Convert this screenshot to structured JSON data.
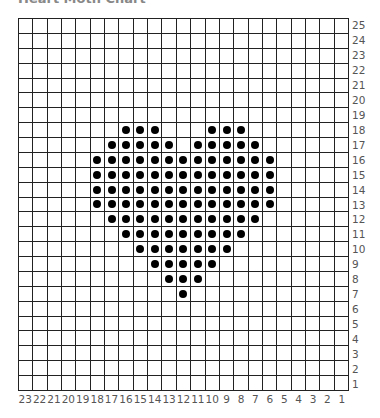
{
  "title": "Heart Moth Chart",
  "chart_data": {
    "type": "table",
    "title": "Heart Moth Chart",
    "columns": 23,
    "rows": 25,
    "column_labels": [
      23,
      22,
      21,
      20,
      19,
      18,
      17,
      16,
      15,
      14,
      13,
      12,
      11,
      10,
      9,
      8,
      7,
      6,
      5,
      4,
      3,
      2,
      1
    ],
    "row_labels": [
      25,
      24,
      23,
      22,
      21,
      20,
      19,
      18,
      17,
      16,
      15,
      14,
      13,
      12,
      11,
      10,
      9,
      8,
      7,
      6,
      5,
      4,
      3,
      2,
      1
    ],
    "filled_cells_by_row": {
      "18": [
        16,
        15,
        14,
        10,
        9,
        8
      ],
      "17": [
        17,
        16,
        15,
        14,
        13,
        11,
        10,
        9,
        8,
        7
      ],
      "16": [
        18,
        17,
        16,
        15,
        14,
        13,
        12,
        11,
        10,
        9,
        8,
        7,
        6
      ],
      "15": [
        18,
        17,
        16,
        15,
        14,
        13,
        12,
        11,
        10,
        9,
        8,
        7,
        6
      ],
      "14": [
        18,
        17,
        16,
        15,
        14,
        13,
        12,
        11,
        10,
        9,
        8,
        7,
        6
      ],
      "13": [
        18,
        17,
        16,
        15,
        14,
        13,
        12,
        11,
        10,
        9,
        8,
        7,
        6
      ],
      "12": [
        17,
        16,
        15,
        14,
        13,
        12,
        11,
        10,
        9,
        8,
        7
      ],
      "11": [
        16,
        15,
        14,
        13,
        12,
        11,
        10,
        9,
        8
      ],
      "10": [
        15,
        14,
        13,
        12,
        11,
        10,
        9
      ],
      "9": [
        14,
        13,
        12,
        11,
        10
      ],
      "8": [
        13,
        12,
        11
      ],
      "7": [
        12
      ]
    },
    "grid": true
  }
}
